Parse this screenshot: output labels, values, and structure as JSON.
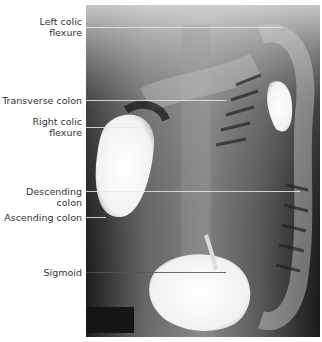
{
  "figure": {
    "labels": [
      {
        "text": "Left colic\nflexure",
        "y": 27
      },
      {
        "text": "Transverse colon",
        "y": 100
      },
      {
        "text": "Right colic\nflexure",
        "y": 127
      },
      {
        "text": "Descending colon",
        "y": 191
      },
      {
        "text": "Ascending colon",
        "y": 217
      },
      {
        "text": "Sigmoid",
        "y": 272
      }
    ]
  }
}
